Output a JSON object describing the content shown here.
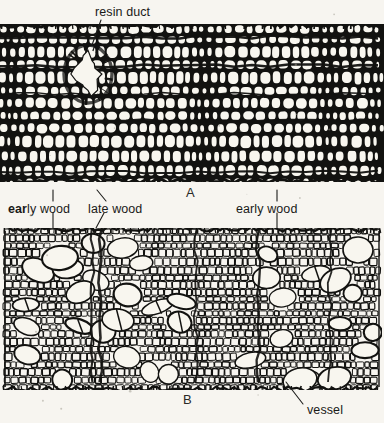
{
  "figure": {
    "background_color": "#f7f5f0",
    "ink_color": "#121210",
    "lumen_color": "#f8f6ef"
  },
  "labels": {
    "resin_duct": "resin duct",
    "early_wood_left": "early wood",
    "early_wood_left_bold_prefix": "ear",
    "early_wood_left_rest": "ly wood",
    "late_wood": "late wood",
    "early_wood_right": "early wood",
    "vessel": "vessel"
  },
  "panels": [
    {
      "letter": "A",
      "caption": "A",
      "subject": "softwood-conifer-cross-section"
    },
    {
      "letter": "B",
      "caption": "B",
      "subject": "hardwood-cross-section"
    }
  ],
  "panel_a": {
    "letter": "A",
    "x": 0,
    "y": 24,
    "width": 384,
    "height": 158,
    "description": "conifer wood cross section with resin duct, early wood and late wood bands",
    "latewood_bands_x": [
      8,
      196,
      322,
      372
    ],
    "resin_duct": {
      "cx": 88,
      "cy": 74,
      "rx": 15,
      "ry": 22
    }
  },
  "panel_b": {
    "letter": "B",
    "x": 4,
    "y": 228,
    "width": 376,
    "height": 162,
    "description": "hardwood cross section with scattered large vessels in fibre ground tissue",
    "vessel_count": 34
  },
  "leaders": [
    {
      "name": "resin-duct-leader",
      "x1": 101,
      "y1": 20,
      "x2": 92,
      "y2": 45
    },
    {
      "name": "early-wood-left-leader-up",
      "x1": 53,
      "y1": 190,
      "x2": 53,
      "y2": 201
    },
    {
      "name": "early-wood-left-leader-down",
      "x1": 53,
      "y1": 213,
      "x2": 53,
      "y2": 228
    },
    {
      "name": "late-wood-leader-up",
      "x1": 97,
      "y1": 190,
      "x2": 106,
      "y2": 201
    },
    {
      "name": "late-wood-leader-down",
      "x1": 96,
      "y1": 228,
      "x2": 104,
      "y2": 213
    },
    {
      "name": "early-wood-right-leader-up",
      "x1": 277,
      "y1": 190,
      "x2": 277,
      "y2": 201
    },
    {
      "name": "early-wood-right-leader-down",
      "x1": 277,
      "y1": 213,
      "x2": 277,
      "y2": 228
    },
    {
      "name": "vessel-leader",
      "x1": 286,
      "y1": 382,
      "x2": 303,
      "y2": 404
    }
  ],
  "label_positions": {
    "resin_duct": {
      "x": 95,
      "y": 16
    },
    "early_wood_left": {
      "x": 8,
      "y": 213
    },
    "late_wood": {
      "x": 88,
      "y": 213
    },
    "early_wood_right": {
      "x": 236,
      "y": 213
    },
    "vessel": {
      "x": 307,
      "y": 414
    },
    "panel_a_letter": {
      "x": 186,
      "y": 197
    },
    "panel_b_letter": {
      "x": 183,
      "y": 404
    }
  }
}
